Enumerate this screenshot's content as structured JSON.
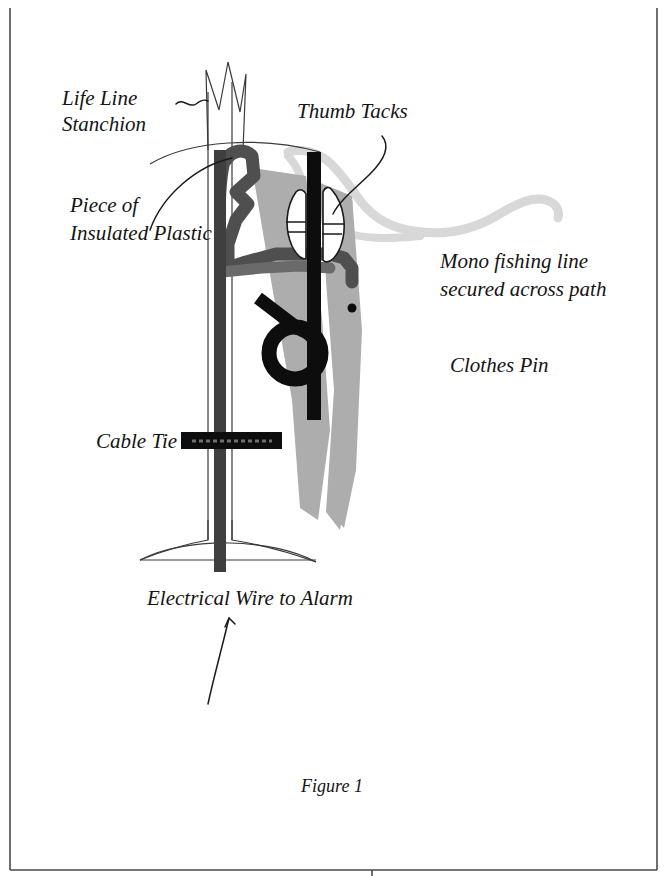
{
  "figure": {
    "caption": "Figure 1"
  },
  "labels": [
    {
      "id": "life-line-stanchion",
      "line1": "Life Line",
      "line2": "Stanchion",
      "x": 62,
      "y": 105,
      "anchor": "start"
    },
    {
      "id": "piece-of-insulated-plastic",
      "line1": "Piece of",
      "line2": "Insulated Plastic",
      "x": 70,
      "y": 212,
      "anchor": "start"
    },
    {
      "id": "thumb-tacks",
      "line1": "Thumb Tacks",
      "line2": "",
      "x": 297,
      "y": 118,
      "anchor": "start"
    },
    {
      "id": "mono-fishing-line",
      "line1": "Mono fishing line",
      "line2": "secured across path",
      "x": 440,
      "y": 268,
      "anchor": "start"
    },
    {
      "id": "clothes-pin",
      "line1": "Clothes Pin",
      "line2": "",
      "x": 450,
      "y": 372,
      "anchor": "start"
    },
    {
      "id": "cable-tie",
      "line1": "Cable Tie",
      "line2": "",
      "x": 96,
      "y": 448,
      "anchor": "start"
    },
    {
      "id": "electrical-wire-to-alarm",
      "line1": "Electrical Wire to Alarm",
      "line2": "",
      "x": 147,
      "y": 605,
      "anchor": "start"
    }
  ],
  "colors": {
    "background": "#ffffff",
    "ink": "#141414",
    "border": "#4a4a4a",
    "clothespin_gray": "#adadad",
    "fishing_line_gray": "#d8d8d8",
    "insulated_wire_gray": "#4f4f4f",
    "thumb_tack_black": "#0d0d0d",
    "cable_tie_black": "#0d0d0d",
    "spring_black": "#0d0d0d",
    "wire_dark": "#3f3f3f"
  },
  "parts": [
    {
      "name": "stanchion-post",
      "description": "vertical tube with zigzag crown top and flared base"
    },
    {
      "name": "stanchion-base",
      "description": "flared foot of the stanchion"
    },
    {
      "name": "insulated-plastic-wire",
      "description": "dark gray zigzag insulated plastic piece over the stanchion"
    },
    {
      "name": "clothes-pin",
      "description": "light gray wooden clothes pin clamped to the stanchion"
    },
    {
      "name": "clothes-pin-spring",
      "description": "black coiled spring with lever arm"
    },
    {
      "name": "thumb-tacks",
      "description": "two thumb tacks pinned either side of a black contact strip"
    },
    {
      "name": "contact-strip",
      "description": "vertical black contact bar between the thumb tacks"
    },
    {
      "name": "mono-fishing-line",
      "description": "pale gray monofilament line running off to the right"
    },
    {
      "name": "cable-tie",
      "description": "black horizontal cable tie band around the post"
    },
    {
      "name": "electrical-wire",
      "description": "dark wire running down the post to the alarm"
    }
  ],
  "page_frame": {
    "left": 10,
    "top": 8,
    "right": 657,
    "bottom": 870,
    "gutter_tick_x": 372
  }
}
